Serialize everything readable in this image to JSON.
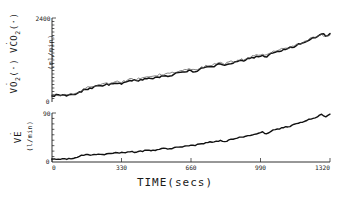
{
  "chart_data": {
    "type": "line",
    "title": "",
    "xlabel": "TIME(secs)",
    "xlim": [
      0,
      1320
    ],
    "xticks": [
      0,
      330,
      660,
      990,
      1320
    ],
    "xticklabels": [
      "0",
      "330",
      "660",
      "990",
      "1320"
    ],
    "grid": false,
    "legend": "none",
    "panels": [
      {
        "id": "panel-vo2-vco2",
        "ylabel": "VO2(·) VCO2(·)",
        "ylabel_units": "(ml/min)",
        "ylim": [
          0,
          2400
        ],
        "yticks": [
          0,
          2400
        ],
        "yticklabels": [
          "0",
          "2400"
        ],
        "minor_tick_count": 24,
        "series": [
          {
            "name": "VO2",
            "style": "thick-dark",
            "x": [
              0,
              20,
              40,
              60,
              80,
              100,
              120,
              140,
              160,
              180,
              200,
              220,
              240,
              260,
              280,
              300,
              320,
              340,
              360,
              380,
              400,
              420,
              440,
              460,
              480,
              500,
              520,
              540,
              560,
              580,
              600,
              620,
              640,
              660,
              680,
              700,
              720,
              740,
              760,
              780,
              800,
              820,
              840,
              860,
              880,
              900,
              920,
              940,
              960,
              980,
              1000,
              1020,
              1040,
              1060,
              1080,
              1100,
              1120,
              1140,
              1160,
              1180,
              1200,
              1220,
              1240,
              1260,
              1280,
              1300,
              1320
            ],
            "values": [
              195,
              200,
              205,
              198,
              210,
              215,
              240,
              300,
              365,
              400,
              420,
              455,
              470,
              500,
              515,
              540,
              520,
              560,
              585,
              610,
              600,
              640,
              665,
              690,
              680,
              720,
              745,
              770,
              760,
              800,
              825,
              850,
              870,
              900,
              880,
              930,
              960,
              990,
              1010,
              1050,
              1080,
              1030,
              1090,
              1120,
              1150,
              1180,
              1210,
              1245,
              1275,
              1310,
              1340,
              1300,
              1380,
              1420,
              1450,
              1490,
              1530,
              1570,
              1620,
              1670,
              1720,
              1780,
              1830,
              1890,
              1960,
              1900,
              1950
            ]
          },
          {
            "name": "VCO2",
            "style": "thin-light",
            "x": [
              0,
              20,
              40,
              60,
              80,
              100,
              120,
              140,
              160,
              180,
              200,
              220,
              240,
              260,
              280,
              300,
              320,
              340,
              360,
              380,
              400,
              420,
              440,
              460,
              480,
              500,
              520,
              540,
              560,
              580,
              600,
              620,
              640,
              660,
              680,
              700,
              720,
              740,
              760,
              780,
              800,
              820,
              840,
              860,
              880,
              900,
              920,
              940,
              960,
              980,
              1000,
              1020,
              1040,
              1060,
              1080,
              1100,
              1120,
              1140,
              1160,
              1180,
              1200,
              1220,
              1240,
              1260,
              1280,
              1300,
              1320
            ],
            "values": [
              200,
              205,
              202,
              208,
              215,
              230,
              270,
              340,
              400,
              430,
              450,
              490,
              505,
              535,
              550,
              580,
              560,
              600,
              625,
              650,
              645,
              685,
              705,
              730,
              720,
              760,
              785,
              810,
              805,
              840,
              865,
              890,
              905,
              940,
              920,
              970,
              1000,
              1030,
              1045,
              1085,
              1115,
              1070,
              1125,
              1155,
              1185,
              1215,
              1245,
              1280,
              1310,
              1345,
              1375,
              1335,
              1410,
              1450,
              1480,
              1515,
              1555,
              1595,
              1640,
              1685,
              1730,
              1785,
              1835,
              1880,
              1930,
              1880,
              1900
            ]
          }
        ]
      },
      {
        "id": "panel-ve",
        "ylabel": "VE",
        "ylabel_units": "(l/min)",
        "ylim": [
          0,
          90
        ],
        "yticks": [
          0,
          90
        ],
        "yticklabels": [
          "0",
          "90"
        ],
        "minor_tick_count": 9,
        "series": [
          {
            "name": "VE",
            "style": "thick-dark",
            "x": [
              0,
              20,
              40,
              60,
              80,
              100,
              120,
              140,
              160,
              180,
              200,
              220,
              240,
              260,
              280,
              300,
              320,
              340,
              360,
              380,
              400,
              420,
              440,
              460,
              480,
              500,
              520,
              540,
              560,
              580,
              600,
              620,
              640,
              660,
              680,
              700,
              720,
              740,
              760,
              780,
              800,
              820,
              840,
              860,
              880,
              900,
              920,
              940,
              960,
              980,
              1000,
              1020,
              1040,
              1060,
              1080,
              1100,
              1120,
              1140,
              1160,
              1180,
              1200,
              1220,
              1240,
              1260,
              1280,
              1300,
              1320
            ],
            "values": [
              5,
              5,
              5,
              6,
              6,
              7,
              9,
              12,
              13,
              12,
              13,
              14,
              14,
              15,
              16,
              17,
              16,
              17,
              18,
              19,
              18,
              20,
              21,
              22,
              21,
              23,
              24,
              25,
              24,
              26,
              27,
              28,
              29,
              31,
              30,
              33,
              34,
              36,
              36,
              38,
              40,
              37,
              41,
              42,
              44,
              45,
              47,
              49,
              51,
              53,
              55,
              52,
              57,
              59,
              61,
              63,
              65,
              67,
              70,
              72,
              75,
              78,
              80,
              83,
              87,
              83,
              88
            ]
          }
        ]
      }
    ]
  },
  "geometry": {
    "plot_left": 52,
    "plot_right": 330,
    "top_panel_top": 18,
    "top_panel_bottom": 102,
    "bottom_panel_top": 113,
    "bottom_panel_bottom": 162
  }
}
